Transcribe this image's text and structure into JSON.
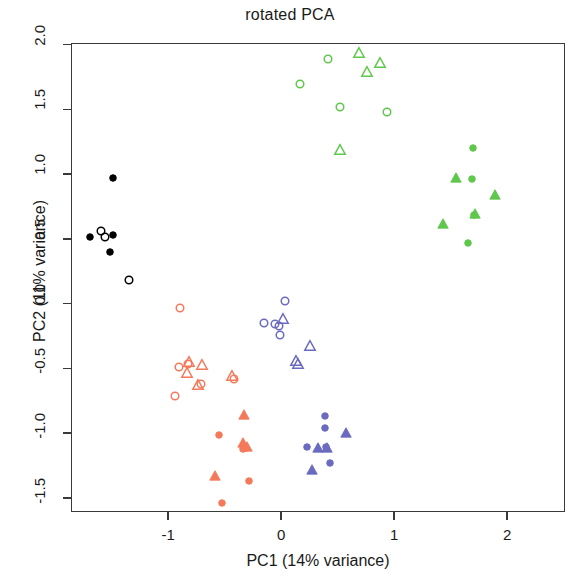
{
  "chart_data": {
    "type": "scatter",
    "title": "rotated PCA",
    "xlabel": "PC1 (14% variance)",
    "ylabel": "PC2 (11% variance)",
    "xlim": [
      -1.861,
      2.513
    ],
    "ylim": [
      -1.609,
      2.013
    ],
    "xticks": [
      -1,
      0,
      1,
      2
    ],
    "xticklabels": [
      "-1",
      "0",
      "1",
      "2"
    ],
    "yticks": [
      -1.5,
      -1.0,
      -0.5,
      0.0,
      0.5,
      1.0,
      1.5,
      2.0
    ],
    "yticklabels": [
      "-1.5",
      "-1.0",
      "-0.5",
      "0.0",
      "0.5",
      "1.0",
      "1.5",
      "2.0"
    ],
    "grid": false,
    "legend": "none",
    "colors": {
      "black": "#000000",
      "salmon": "#F4795B",
      "blue": "#6A6AC0",
      "green": "#5FC74B",
      "frame": "#3A3A3A",
      "background": "#FFFFFF"
    },
    "series": [
      {
        "name": "black filled circles",
        "color": "#000000",
        "marker": "circle",
        "fill": "solid",
        "points": [
          {
            "x": -1.487,
            "y": 0.967
          },
          {
            "x": -1.69,
            "y": 0.517
          },
          {
            "x": -1.487,
            "y": 0.528
          },
          {
            "x": -1.513,
            "y": 0.401
          }
        ]
      },
      {
        "name": "black open circles",
        "color": "#000000",
        "marker": "circle",
        "fill": "open",
        "points": [
          {
            "x": -1.593,
            "y": 0.558
          },
          {
            "x": -1.558,
            "y": 0.513
          },
          {
            "x": -1.345,
            "y": 0.18
          }
        ]
      },
      {
        "name": "salmon open circles",
        "color": "#F4795B",
        "marker": "circle",
        "fill": "open",
        "points": [
          {
            "x": -0.894,
            "y": -0.034
          },
          {
            "x": -0.903,
            "y": -0.491
          },
          {
            "x": -0.823,
            "y": -0.468
          },
          {
            "x": -0.708,
            "y": -0.618
          },
          {
            "x": -0.938,
            "y": -0.712
          },
          {
            "x": -0.416,
            "y": -0.584
          }
        ]
      },
      {
        "name": "salmon open triangles",
        "color": "#F4795B",
        "marker": "triangle",
        "fill": "open",
        "points": [
          {
            "x": -0.832,
            "y": -0.539
          },
          {
            "x": -0.814,
            "y": -0.453
          },
          {
            "x": -0.699,
            "y": -0.472
          },
          {
            "x": -0.735,
            "y": -0.629
          },
          {
            "x": -0.434,
            "y": -0.562
          }
        ]
      },
      {
        "name": "salmon filled circles",
        "color": "#F4795B",
        "marker": "circle",
        "fill": "solid",
        "points": [
          {
            "x": -0.31,
            "y": -1.113
          },
          {
            "x": -0.336,
            "y": -1.124
          },
          {
            "x": -0.522,
            "y": -1.543
          },
          {
            "x": -0.283,
            "y": -1.371
          },
          {
            "x": -0.548,
            "y": -1.015
          }
        ]
      },
      {
        "name": "salmon filled triangles",
        "color": "#F4795B",
        "marker": "triangle",
        "fill": "solid",
        "points": [
          {
            "x": -0.327,
            "y": -0.861
          },
          {
            "x": -0.336,
            "y": -1.079
          },
          {
            "x": -0.301,
            "y": -1.109
          },
          {
            "x": -0.584,
            "y": -1.33
          }
        ]
      },
      {
        "name": "blue open circles",
        "color": "#6A6AC0",
        "marker": "circle",
        "fill": "open",
        "points": [
          {
            "x": 0.035,
            "y": 0.019
          },
          {
            "x": -0.15,
            "y": -0.15
          },
          {
            "x": -0.053,
            "y": -0.154
          },
          {
            "x": -0.018,
            "y": -0.169
          },
          {
            "x": -0.009,
            "y": -0.244
          }
        ]
      },
      {
        "name": "blue open triangles",
        "color": "#6A6AC0",
        "marker": "triangle",
        "fill": "open",
        "points": [
          {
            "x": 0.018,
            "y": -0.12
          },
          {
            "x": 0.257,
            "y": -0.326
          },
          {
            "x": 0.133,
            "y": -0.442
          },
          {
            "x": 0.15,
            "y": -0.468
          }
        ]
      },
      {
        "name": "blue filled circles",
        "color": "#6A6AC0",
        "marker": "circle",
        "fill": "solid",
        "points": [
          {
            "x": 0.389,
            "y": -0.869
          },
          {
            "x": 0.389,
            "y": -0.959
          },
          {
            "x": 0.23,
            "y": -1.109
          },
          {
            "x": 0.398,
            "y": -1.109
          },
          {
            "x": 0.434,
            "y": -1.229
          }
        ]
      },
      {
        "name": "blue filled triangles",
        "color": "#6A6AC0",
        "marker": "triangle",
        "fill": "solid",
        "points": [
          {
            "x": 0.575,
            "y": -0.999
          },
          {
            "x": 0.327,
            "y": -1.113
          },
          {
            "x": 0.407,
            "y": -1.113
          },
          {
            "x": 0.274,
            "y": -1.285
          }
        ]
      },
      {
        "name": "green open circles",
        "color": "#5FC74B",
        "marker": "circle",
        "fill": "open",
        "points": [
          {
            "x": 0.416,
            "y": 1.888
          },
          {
            "x": 0.168,
            "y": 1.7
          },
          {
            "x": 0.522,
            "y": 1.521
          },
          {
            "x": 0.938,
            "y": 1.48
          }
        ]
      },
      {
        "name": "green open triangles",
        "color": "#5FC74B",
        "marker": "triangle",
        "fill": "open",
        "points": [
          {
            "x": 0.69,
            "y": 1.933
          },
          {
            "x": 0.876,
            "y": 1.858
          },
          {
            "x": 0.761,
            "y": 1.79
          },
          {
            "x": 0.522,
            "y": 1.184
          }
        ]
      },
      {
        "name": "green filled circles",
        "color": "#5FC74B",
        "marker": "circle",
        "fill": "solid",
        "points": [
          {
            "x": 1.699,
            "y": 1.199
          },
          {
            "x": 1.69,
            "y": 0.965
          },
          {
            "x": 1.708,
            "y": 0.684
          },
          {
            "x": 1.655,
            "y": 0.472
          }
        ]
      },
      {
        "name": "green filled triangles",
        "color": "#5FC74B",
        "marker": "triangle",
        "fill": "solid",
        "points": [
          {
            "x": 1.549,
            "y": 0.969
          },
          {
            "x": 1.894,
            "y": 0.839
          },
          {
            "x": 1.717,
            "y": 0.695
          },
          {
            "x": 1.434,
            "y": 0.614
          }
        ]
      }
    ]
  }
}
